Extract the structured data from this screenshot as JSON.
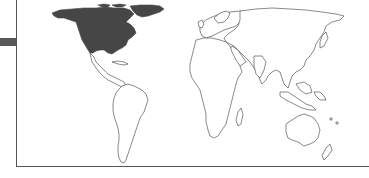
{
  "map": {
    "type": "world-choropleth",
    "highlighted_region": "North America",
    "colors": {
      "background": "#ffffff",
      "highlight_fill": "#464646",
      "land_fill": "#ffffff",
      "outline": "#3a3a3a",
      "frame": "#555555",
      "side_bar": "#5a5a5a"
    }
  }
}
